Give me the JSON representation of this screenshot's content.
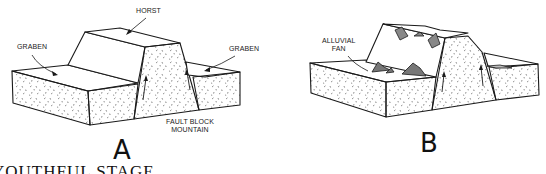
{
  "figure": {
    "caption": "YOUTHFUL STAGE",
    "panels": [
      {
        "id": "A",
        "letter": "A",
        "labels": {
          "horst": "HORST",
          "graben_left": "GRABEN",
          "graben_right": "GRABEN",
          "fault_block_line1": "FAULT BLOCK",
          "fault_block_line2": "MOUNTAIN"
        }
      },
      {
        "id": "B",
        "letter": "B",
        "labels": {
          "alluvial_line1": "ALLUVIAL",
          "alluvial_line2": "FAN"
        }
      }
    ]
  },
  "colors": {
    "ink": "#1a1a1a",
    "background": "#ffffff"
  }
}
